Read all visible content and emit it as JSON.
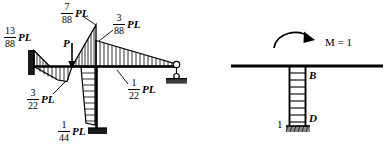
{
  "figure": {
    "background_color": "#ffffff",
    "line_color": "#000000"
  },
  "left_diagram": {
    "name": "bending-moment-diagram",
    "load_label": "P",
    "labels": [
      {
        "id": "m-left-support",
        "num": "13",
        "den": "88",
        "unit": "PL"
      },
      {
        "id": "m-peak-top",
        "num": "7",
        "den": "88",
        "unit": "PL"
      },
      {
        "id": "m-right-of-peak",
        "num": "3",
        "den": "88",
        "unit": "PL"
      },
      {
        "id": "m-under-load",
        "num": "3",
        "den": "22",
        "unit": "PL"
      },
      {
        "id": "m-beam-right",
        "num": "1",
        "den": "22",
        "unit": "PL"
      },
      {
        "id": "m-column-base",
        "num": "1",
        "den": "44",
        "unit": "PL"
      }
    ]
  },
  "right_diagram": {
    "name": "unit-moment-load-case",
    "moment_label": "M = 1",
    "joint_label_top": "B",
    "joint_label_bottom": "D",
    "member_label": "1"
  }
}
